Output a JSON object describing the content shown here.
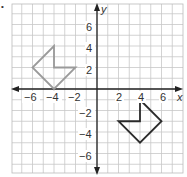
{
  "chart_data": {
    "type": "coordinate-plane",
    "title": "",
    "xlabel": "x",
    "ylabel": "y",
    "xlim": [
      -8,
      8
    ],
    "ylim": [
      -8,
      8
    ],
    "grid": true,
    "x_ticks": [
      "−6",
      "−4",
      "−2",
      "2",
      "4",
      "6"
    ],
    "y_ticks": [
      "6",
      "4",
      "2",
      "−2",
      "−4",
      "−6"
    ],
    "figures": [
      {
        "name": "preimage",
        "color": "#9a9a9a",
        "vertices": [
          [
            -4,
            4
          ],
          [
            -4,
            2
          ],
          [
            -2,
            2
          ],
          [
            -4,
            0
          ],
          [
            -6,
            2
          ]
        ]
      },
      {
        "name": "image",
        "color": "#2b2b2b",
        "vertices": [
          [
            4,
            -1
          ],
          [
            4,
            -3
          ],
          [
            2,
            -3
          ],
          [
            4,
            -5
          ],
          [
            6,
            -3
          ]
        ]
      }
    ]
  },
  "labels": {
    "x_axis": "x",
    "y_axis": "y",
    "xt": {
      "n6": "−6",
      "n4": "−4",
      "n2": "−2",
      "p2": "2",
      "p4": "4",
      "p6": "6"
    },
    "yt": {
      "p6": "6",
      "p4": "4",
      "p2": "2",
      "n2": "−2",
      "n4": "−4",
      "n6": "−6"
    }
  },
  "marker": "•"
}
